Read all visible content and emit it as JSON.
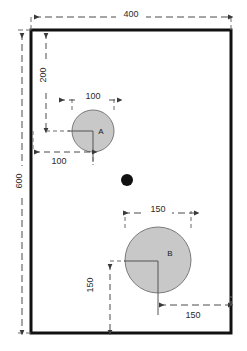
{
  "diagram": {
    "units_note": "",
    "colors": {
      "plate_outline": "#111111",
      "plate_fill": "#ffffff",
      "circle_fill": "#c8c8c8",
      "circle_stroke": "#7a7a7a",
      "dot_fill": "#111111",
      "dimension_line": "#4a4a4a",
      "center_line": "#555555",
      "text": "#2b2b2b",
      "background": "#ffffff"
    },
    "plate": {
      "width_label": "400",
      "height_label": "600"
    },
    "shapes": [
      {
        "name": "circle-a",
        "label": "A",
        "cx": 93,
        "cy": 131,
        "r": 21,
        "diameter_label": "100",
        "offset_x_label": "100",
        "offset_y_label": "200"
      },
      {
        "name": "circle-b",
        "label": "B",
        "cx": 158,
        "cy": 260,
        "r": 33,
        "diameter_label": "150",
        "offset_x_label": "150",
        "offset_y_label": "150"
      },
      {
        "name": "point-dot",
        "label": "",
        "cx": 127,
        "cy": 180,
        "r": 6
      }
    ],
    "dimensions": [
      {
        "name": "plate-width",
        "value": "400",
        "orientation": "horizontal"
      },
      {
        "name": "plate-height",
        "value": "600",
        "orientation": "vertical"
      },
      {
        "name": "circle-a-diameter",
        "value": "100",
        "orientation": "horizontal"
      },
      {
        "name": "circle-a-offset-top",
        "value": "200",
        "orientation": "vertical"
      },
      {
        "name": "circle-a-offset-left",
        "value": "100",
        "orientation": "horizontal"
      },
      {
        "name": "circle-b-diameter",
        "value": "150",
        "orientation": "horizontal"
      },
      {
        "name": "circle-b-offset-bottom",
        "value": "150",
        "orientation": "vertical"
      },
      {
        "name": "circle-b-offset-right",
        "value": "150",
        "orientation": "horizontal"
      }
    ]
  }
}
